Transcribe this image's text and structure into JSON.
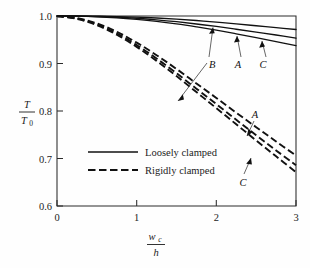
{
  "chart_data": {
    "type": "line",
    "title": "",
    "subtitle": "",
    "xlabel": "w_c / h",
    "xlabel_numerator": "w",
    "xlabel_numerator_sub": "c",
    "xlabel_denominator": "h",
    "ylabel": "T / T_0",
    "ylabel_numerator": "T",
    "ylabel_denominator": "T",
    "ylabel_denominator_sub": "0",
    "xlim": [
      0,
      3
    ],
    "ylim": [
      0.6,
      1.0
    ],
    "xticks": [
      0,
      1,
      2,
      3
    ],
    "xticklabels": [
      "0",
      "1",
      "2",
      "3"
    ],
    "yticks": [
      0.6,
      0.7,
      0.8,
      0.9,
      1.0
    ],
    "yticklabels": [
      "0.6",
      "0.7",
      "0.8",
      "0.9",
      "1.0"
    ],
    "grid": false,
    "legend_position": "center-left",
    "series": [
      {
        "name": "B",
        "group": "Loosely clamped",
        "style": "solid",
        "x": [
          0,
          0.25,
          0.5,
          0.75,
          1.0,
          1.25,
          1.5,
          1.75,
          2.0,
          2.25,
          2.5,
          2.75,
          3.0
        ],
        "values": [
          1.0,
          1.0,
          0.9995,
          0.9988,
          0.9975,
          0.9958,
          0.9935,
          0.9905,
          0.987,
          0.9835,
          0.9795,
          0.9755,
          0.9715
        ]
      },
      {
        "name": "A",
        "group": "Loosely clamped",
        "style": "solid",
        "x": [
          0,
          0.25,
          0.5,
          0.75,
          1.0,
          1.25,
          1.5,
          1.75,
          2.0,
          2.25,
          2.5,
          2.75,
          3.0
        ],
        "values": [
          1.0,
          0.9998,
          0.999,
          0.9975,
          0.9952,
          0.992,
          0.988,
          0.9832,
          0.978,
          0.9722,
          0.9662,
          0.96,
          0.9535
        ]
      },
      {
        "name": "C",
        "group": "Loosely clamped",
        "style": "solid",
        "x": [
          0,
          0.25,
          0.5,
          0.75,
          1.0,
          1.25,
          1.5,
          1.75,
          2.0,
          2.25,
          2.5,
          2.75,
          3.0
        ],
        "values": [
          1.0,
          0.9996,
          0.9985,
          0.9963,
          0.993,
          0.9888,
          0.9835,
          0.9772,
          0.9702,
          0.9625,
          0.9545,
          0.946,
          0.9375
        ]
      },
      {
        "name": "B",
        "group": "Rigidly clamped",
        "style": "dashed",
        "x": [
          0,
          0.25,
          0.5,
          0.75,
          1.0,
          1.25,
          1.5,
          1.75,
          2.0,
          2.25,
          2.5,
          2.75,
          3.0
        ],
        "values": [
          1.0,
          0.9955,
          0.9845,
          0.967,
          0.944,
          0.9175,
          0.8885,
          0.858,
          0.8275,
          0.7965,
          0.766,
          0.736,
          0.706
        ]
      },
      {
        "name": "A",
        "group": "Rigidly clamped",
        "style": "dashed",
        "x": [
          0,
          0.25,
          0.5,
          0.75,
          1.0,
          1.25,
          1.5,
          1.75,
          2.0,
          2.25,
          2.5,
          2.75,
          3.0
        ],
        "values": [
          1.0,
          0.9948,
          0.9825,
          0.9635,
          0.939,
          0.9105,
          0.8795,
          0.847,
          0.8145,
          0.7815,
          0.749,
          0.717,
          0.686
        ]
      },
      {
        "name": "C",
        "group": "Rigidly clamped",
        "style": "dashed",
        "x": [
          0,
          0.25,
          0.5,
          0.75,
          1.0,
          1.25,
          1.5,
          1.75,
          2.0,
          2.25,
          2.5,
          2.75,
          3.0
        ],
        "values": [
          1.0,
          0.994,
          0.9808,
          0.9605,
          0.935,
          0.9055,
          0.8735,
          0.8398,
          0.806,
          0.772,
          0.738,
          0.7045,
          0.671
        ]
      }
    ],
    "legend": [
      {
        "label": "Loosely clamped",
        "style": "solid"
      },
      {
        "label": "Rigidly clamped",
        "style": "dashed"
      }
    ],
    "annotations": [
      {
        "text": "B",
        "target": "rigidly-clamped-B",
        "label_x": 1.99,
        "label_y": 0.918
      },
      {
        "text": "A",
        "target": "loosely-clamped-A",
        "label_x": 2.36,
        "label_y": 0.918
      },
      {
        "text": "C",
        "target": "loosely-clamped-C",
        "label_x": 2.62,
        "label_y": 0.918
      },
      {
        "text": "A",
        "target": "rigidly-clamped-A",
        "label_x": 2.52,
        "label_y": 0.787
      },
      {
        "text": "C",
        "target": "rigidly-clamped-C",
        "label_x": 2.43,
        "label_y": 0.676
      }
    ]
  }
}
